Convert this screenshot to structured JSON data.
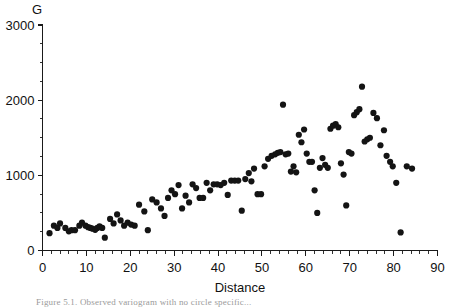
{
  "figure": {
    "caption_fragment": "Figure 5.1.  Observed variogram with no circle specific...",
    "background_color": "#ffffff",
    "marker_color": "#141414",
    "axis_color": "#1a1a1a"
  },
  "chart_data": {
    "type": "scatter",
    "title": "",
    "subtitle": "",
    "xlabel": "Distance",
    "ylabel": "G",
    "xlim": [
      0,
      90
    ],
    "ylim": [
      0,
      3000
    ],
    "x_major_ticks": [
      0,
      10,
      20,
      30,
      40,
      50,
      60,
      70,
      80,
      90
    ],
    "x_tick_labels": [
      "0",
      "10",
      "20",
      "30",
      "40",
      "50",
      "60",
      "70",
      "80",
      "90"
    ],
    "x_minor_interval": 2,
    "y_major_ticks": [
      0,
      1000,
      2000,
      3000
    ],
    "y_tick_labels": [
      "0",
      "1000",
      "2000",
      "3000"
    ],
    "y_minor_interval": 250,
    "grid": false,
    "legend": null,
    "legend_position": "none",
    "marker_size": 3.1,
    "marker_shape": "circle",
    "annotations": [],
    "points": [
      [
        1.6,
        230
      ],
      [
        2.6,
        330
      ],
      [
        3.4,
        300
      ],
      [
        4.0,
        360
      ],
      [
        5.2,
        300
      ],
      [
        6.0,
        255
      ],
      [
        6.6,
        270
      ],
      [
        7.4,
        270
      ],
      [
        8.4,
        330
      ],
      [
        9.0,
        370
      ],
      [
        9.8,
        330
      ],
      [
        10.4,
        310
      ],
      [
        10.9,
        300
      ],
      [
        11.4,
        290
      ],
      [
        12.0,
        275
      ],
      [
        12.5,
        300
      ],
      [
        13.0,
        320
      ],
      [
        13.6,
        300
      ],
      [
        14.2,
        170
      ],
      [
        15.4,
        420
      ],
      [
        16.2,
        360
      ],
      [
        17.0,
        480
      ],
      [
        17.8,
        400
      ],
      [
        18.6,
        330
      ],
      [
        19.4,
        370
      ],
      [
        20.2,
        345
      ],
      [
        21.0,
        330
      ],
      [
        22.0,
        610
      ],
      [
        23.2,
        520
      ],
      [
        24.0,
        270
      ],
      [
        25.0,
        680
      ],
      [
        26.0,
        640
      ],
      [
        27.0,
        560
      ],
      [
        27.8,
        460
      ],
      [
        28.6,
        700
      ],
      [
        29.4,
        800
      ],
      [
        30.2,
        750
      ],
      [
        31.0,
        870
      ],
      [
        31.8,
        560
      ],
      [
        32.6,
        730
      ],
      [
        33.4,
        640
      ],
      [
        34.2,
        880
      ],
      [
        35.0,
        830
      ],
      [
        35.8,
        700
      ],
      [
        36.6,
        700
      ],
      [
        37.4,
        900
      ],
      [
        38.2,
        800
      ],
      [
        39.0,
        880
      ],
      [
        39.8,
        880
      ],
      [
        40.6,
        870
      ],
      [
        41.4,
        900
      ],
      [
        42.2,
        740
      ],
      [
        43.0,
        930
      ],
      [
        43.8,
        930
      ],
      [
        44.6,
        930
      ],
      [
        45.4,
        530
      ],
      [
        46.2,
        950
      ],
      [
        47.0,
        1030
      ],
      [
        47.6,
        920
      ],
      [
        48.2,
        1090
      ],
      [
        49.0,
        750
      ],
      [
        49.8,
        750
      ],
      [
        50.6,
        1120
      ],
      [
        51.4,
        1220
      ],
      [
        52.2,
        1260
      ],
      [
        53.0,
        1280
      ],
      [
        53.6,
        1300
      ],
      [
        54.2,
        1310
      ],
      [
        54.8,
        1940
      ],
      [
        55.4,
        1280
      ],
      [
        56.0,
        1290
      ],
      [
        56.6,
        1050
      ],
      [
        57.2,
        1120
      ],
      [
        57.8,
        1040
      ],
      [
        58.4,
        1540
      ],
      [
        59.0,
        1440
      ],
      [
        59.6,
        1610
      ],
      [
        60.2,
        1290
      ],
      [
        60.8,
        1180
      ],
      [
        61.4,
        1180
      ],
      [
        62.0,
        800
      ],
      [
        62.6,
        500
      ],
      [
        63.2,
        1100
      ],
      [
        63.8,
        1230
      ],
      [
        64.4,
        1140
      ],
      [
        65.0,
        1100
      ],
      [
        65.6,
        1620
      ],
      [
        66.2,
        1660
      ],
      [
        66.8,
        1680
      ],
      [
        67.4,
        1640
      ],
      [
        68.0,
        1160
      ],
      [
        68.6,
        1010
      ],
      [
        69.2,
        600
      ],
      [
        69.8,
        1310
      ],
      [
        70.4,
        1290
      ],
      [
        71.0,
        1800
      ],
      [
        71.6,
        1840
      ],
      [
        72.2,
        1880
      ],
      [
        72.8,
        2180
      ],
      [
        73.4,
        1450
      ],
      [
        74.0,
        1480
      ],
      [
        74.6,
        1500
      ],
      [
        75.4,
        1830
      ],
      [
        76.2,
        1760
      ],
      [
        77.0,
        1400
      ],
      [
        77.8,
        1600
      ],
      [
        78.4,
        1260
      ],
      [
        79.2,
        1180
      ],
      [
        79.8,
        1120
      ],
      [
        80.6,
        900
      ],
      [
        81.6,
        240
      ],
      [
        83.0,
        1120
      ],
      [
        84.2,
        1090
      ]
    ]
  }
}
